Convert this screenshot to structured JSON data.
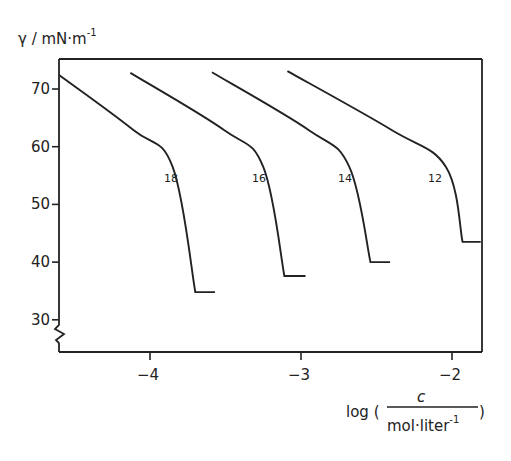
{
  "chart_data": {
    "type": "line",
    "title": "",
    "ylabel": "γ / mN·m⁻¹",
    "ylabel_main": "γ / mN·m",
    "ylabel_sup": "-1",
    "xlabel": "log (c / mol·liter⁻¹)",
    "xlabel_prefix": "log (",
    "xlabel_numerator": "c",
    "xlabel_denominator": "mol·liter",
    "xlabel_denominator_sup": "-1",
    "xlabel_suffix": ")",
    "xlim": [
      -4.6,
      -1.8
    ],
    "ylim": [
      25,
      75
    ],
    "y_axis_break": true,
    "x_ticks": [
      -4,
      -3,
      -2
    ],
    "x_tick_labels": [
      "-4",
      "-3",
      "-2"
    ],
    "y_ticks": [
      30,
      40,
      50,
      60,
      70
    ],
    "y_tick_labels": [
      "30",
      "40",
      "50",
      "60",
      "70"
    ],
    "grid": false,
    "legend": "inline curve labels",
    "series": [
      {
        "name": "18",
        "x": [
          -4.6,
          -4.11,
          -3.85,
          -3.7,
          -3.57
        ],
        "y": [
          72.4,
          62.9,
          56.5,
          34.8,
          34.8
        ]
      },
      {
        "name": "16",
        "x": [
          -4.13,
          -3.51,
          -3.25,
          -3.11,
          -2.97
        ],
        "y": [
          72.8,
          62.9,
          56.5,
          37.6,
          37.6
        ]
      },
      {
        "name": "14",
        "x": [
          -3.59,
          -2.95,
          -2.68,
          -2.54,
          -2.41
        ],
        "y": [
          72.9,
          62.9,
          56.5,
          40.0,
          40.0
        ]
      },
      {
        "name": "12",
        "x": [
          -3.09,
          -2.4,
          -2.04,
          -1.93,
          -1.81
        ],
        "y": [
          73.1,
          62.9,
          56.5,
          43.5,
          43.5
        ]
      }
    ]
  }
}
